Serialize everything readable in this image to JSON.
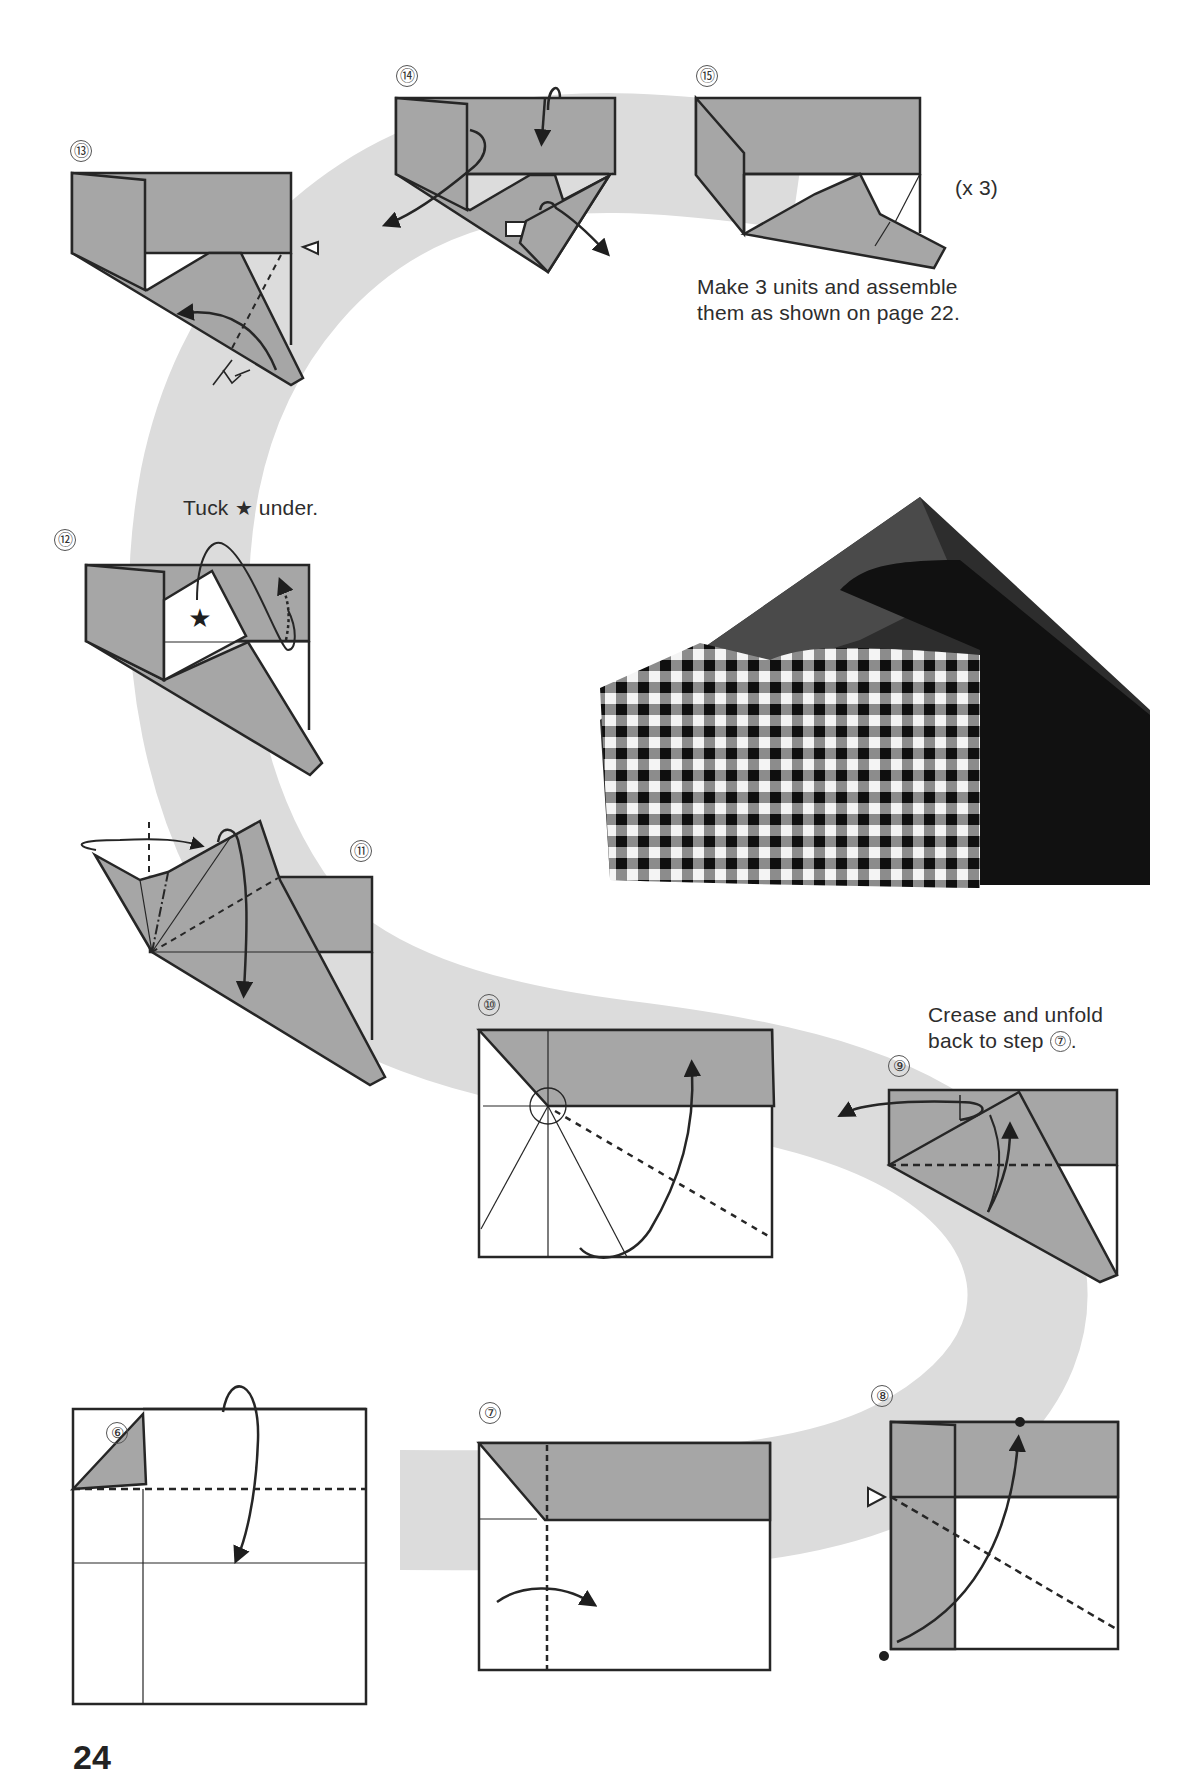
{
  "page": {
    "page_number": "24",
    "colors": {
      "paper_colored_side": "#a6a6a6",
      "path_band": "#dcdcdc",
      "line": "#262626",
      "photo_dark": "#1a1a1a",
      "photo_mid": "#444444"
    }
  },
  "steps": [
    {
      "id": 6,
      "label": "⑥"
    },
    {
      "id": 7,
      "label": "⑦"
    },
    {
      "id": 8,
      "label": "⑧"
    },
    {
      "id": 9,
      "label": "⑨",
      "note_line1": "Crease and unfold",
      "note_line2_prefix": "back to step ",
      "note_ref": "⑦",
      "note_suffix": "."
    },
    {
      "id": 10,
      "label": "⑩"
    },
    {
      "id": 11,
      "label": "⑪"
    },
    {
      "id": 12,
      "label": "⑫",
      "note_prefix": "Tuck ",
      "note_symbol": "★",
      "note_suffix": " under."
    },
    {
      "id": 13,
      "label": "⑬"
    },
    {
      "id": 14,
      "label": "⑭"
    },
    {
      "id": 15,
      "label": "⑮",
      "multiplier": "(x 3)",
      "note_line1": "Make 3 units and assemble",
      "note_line2": "them as shown on page 22."
    }
  ],
  "photo": {
    "subject": "finished-origami-box-gingham-and-black"
  }
}
